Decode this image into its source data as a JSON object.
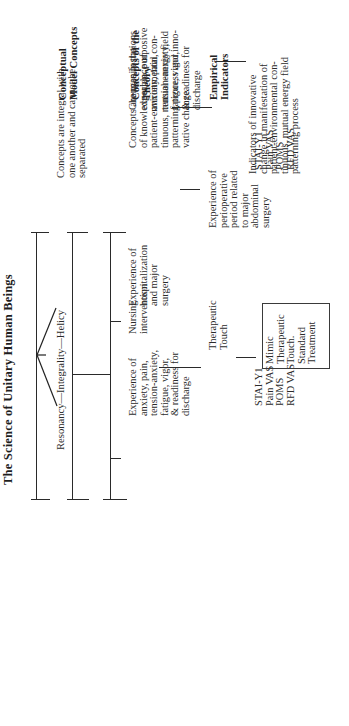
{
  "title": "The Science of Unitary Human Beings",
  "row_labels": {
    "conceptual": "Conceptual\nModel Concepts",
    "theory": "Concepts of the\nTheory",
    "empirical": "Empirical\nIndicators"
  },
  "conceptual_model": {
    "principles": "Resonancy—Integrality—Helicy"
  },
  "theory_concepts": {
    "left": "Experience of\nhospitalization\nand major\nsurgery",
    "middle_left": "Experience of\nanxiety, pain,\ntension-anxiety,\nfatigue, vigor,\n& readiness for\ndischarge",
    "middle_right": "Nursing\nintervention",
    "right": "Changes in the\nexperience of\nanxiety, pain,\ntension-anxiety,\nfatigue, vigor,\n& readiness for\ndischarge"
  },
  "empirical_indicators": {
    "left": "Experience of\nperioperative\nperiod related\nto major\nabdominal\nsurgery",
    "middle_left": "STAI-Y1\nPain VAS\nPOMS\nRFD VAS",
    "middle_right": "Therapeutic\nTouch",
    "middle_box": "Mimic\nTherapeutic\nTouch.\nStandard\nTreatment",
    "right": "STAI-Y1\nPain VAS\nPOMS\nRFD VAS"
  },
  "descriptions": {
    "conceptual": "Concepts are integral with\none another and cannot be\nseparated",
    "theory": "Concepts are manifestations\nof knowledgeable, purposive\npatient-environmental con-\ntinuous, mutual energy field\npatterning process and inno-\nvative change",
    "empirical": "Indicators of innovative\nchange in manifestation of\npatient-environmental con-\ntinuous, mutual energy field\npatterning process"
  }
}
